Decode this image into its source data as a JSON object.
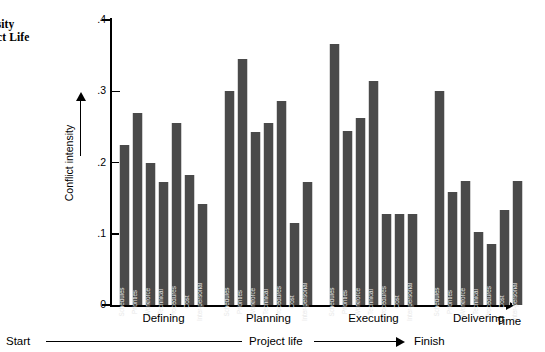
{
  "caption": {
    "line1": "11.5",
    "line2": "Intensity",
    "line3": "Project Life"
  },
  "axis": {
    "y_label": "Conflict intensity",
    "y_ticks": [
      "0",
      ".1",
      ".2",
      ".3",
      ".4"
    ],
    "x_axis_label": "Time"
  },
  "timeline": {
    "start": "Start",
    "middle": "Project life",
    "finish": "Finish"
  },
  "chart_data": {
    "type": "bar",
    "title": "",
    "xlabel": "Time",
    "ylabel": "Conflict intensity",
    "ylim": [
      0,
      0.4
    ],
    "yticks": [
      0,
      0.1,
      0.2,
      0.3,
      0.4
    ],
    "grid": false,
    "legend": "none",
    "categories": [
      "Schedules",
      "Priorities",
      "Workforce",
      "Technical",
      "Procedures",
      "Cost",
      "Inter-personal"
    ],
    "groups": [
      {
        "name": "Defining",
        "values": [
          0.225,
          0.27,
          0.199,
          0.172,
          0.256,
          0.183,
          0.142
        ]
      },
      {
        "name": "Planning",
        "values": [
          0.3,
          0.345,
          0.243,
          0.255,
          0.286,
          0.115,
          0.172
        ]
      },
      {
        "name": "Executing",
        "values": [
          0.366,
          0.244,
          0.262,
          0.314,
          0.128,
          0.128,
          0.128
        ]
      },
      {
        "name": "Delivering",
        "values": [
          0.3,
          0.159,
          0.174,
          0.103,
          0.085,
          0.133,
          0.174
        ]
      }
    ]
  }
}
